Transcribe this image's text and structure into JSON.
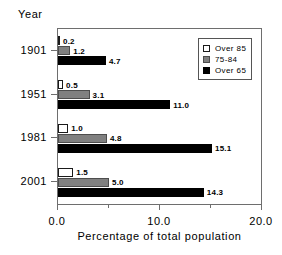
{
  "chart_data": {
    "type": "bar",
    "orientation": "horizontal",
    "title": "",
    "xlabel": "Percentage of total population",
    "ylabel": "Year",
    "xlim": [
      0.0,
      20.0
    ],
    "xticks": [
      "0.0",
      "10.0",
      "20.0"
    ],
    "xtick_values": [
      0.0,
      10.0,
      20.0
    ],
    "minor_ticks": [
      5.0,
      15.0
    ],
    "grid": false,
    "legend_position": "top-right",
    "categories": [
      "1901",
      "1951",
      "1981",
      "2001"
    ],
    "series": [
      {
        "name": "Over 85",
        "swatch": "over85",
        "color": "#ffffff",
        "values": [
          0.2,
          0.5,
          1.0,
          1.5
        ],
        "labels": [
          "0.2",
          "0.5",
          "1.0",
          "1.5"
        ]
      },
      {
        "name": "75-84",
        "swatch": "a7584",
        "color": "#808080",
        "values": [
          1.2,
          3.1,
          4.8,
          5.0
        ],
        "labels": [
          "1.2",
          "3.1",
          "4.8",
          "5.0"
        ]
      },
      {
        "name": "Over 65",
        "swatch": "over65",
        "color": "#000000",
        "values": [
          4.7,
          11.0,
          15.1,
          14.3
        ],
        "labels": [
          "4.7",
          "11.0",
          "15.1",
          "14.3"
        ]
      }
    ]
  },
  "legend": {
    "items": [
      {
        "label": "Over 85",
        "swatch": "over85"
      },
      {
        "label": "75-84",
        "swatch": "a7584"
      },
      {
        "label": "Over 65",
        "swatch": "over65"
      }
    ]
  },
  "colors": {
    "over85": "#ffffff",
    "a7584": "#808080",
    "over65": "#000000",
    "axis": "#6e6e6e",
    "text": "#000000",
    "background": "#ffffff"
  }
}
